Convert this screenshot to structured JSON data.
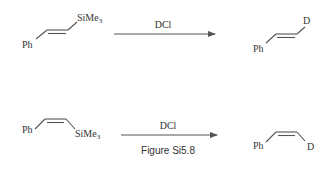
{
  "reactions": [
    {
      "reactant": {
        "left_group": "Ph",
        "right_group": "SiMe",
        "right_sub": "3",
        "geometry": "trans"
      },
      "reagent": "DCl",
      "product": {
        "left_group": "Ph",
        "right_group": "D",
        "geometry": "trans"
      }
    },
    {
      "reactant": {
        "left_group": "Ph",
        "right_group": "SiMe",
        "right_sub": "3",
        "geometry": "cis"
      },
      "reagent": "DCl",
      "product": {
        "left_group": "Ph",
        "right_group": "D",
        "geometry": "cis"
      }
    }
  ],
  "caption": "Figure Si5.8",
  "colors": {
    "ink": "#333333",
    "bond": "#555555",
    "background": "#ffffff"
  }
}
